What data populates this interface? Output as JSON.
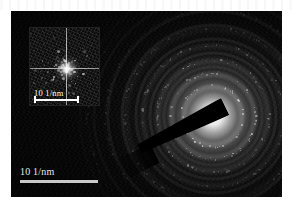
{
  "figure": {
    "kind": "tem-saed-diffraction-pattern",
    "background_color": "#ffffff",
    "canvas_color": "#050505"
  },
  "main_image": {
    "name": "selected-area-electron-diffraction-pattern",
    "scalebar": {
      "label": "10 1/nm",
      "value": 10,
      "unit": "1/nm",
      "length_px": 78,
      "color": "#c9c9c9"
    },
    "beam_stopper": {
      "name": "beam-stopper-bar",
      "color": "#000000"
    },
    "rings": {
      "count": 7,
      "center_x": 202,
      "center_y": 105,
      "radii_px": [
        31,
        43,
        56,
        71,
        88,
        107,
        126
      ],
      "intensity": [
        0.55,
        0.42,
        0.3,
        0.22,
        0.15,
        0.1,
        0.07
      ]
    }
  },
  "inset_image": {
    "name": "fft-inset",
    "scalebar": {
      "label": "10 1/nm",
      "value": 10,
      "unit": "1/nm",
      "length_px": 45,
      "color": "#ffffff"
    },
    "crosshair": {
      "name": "fft-crosshair",
      "color": "#ffffff"
    }
  },
  "chart_data": {
    "type": "scatter",
    "title": "",
    "xlabel": "",
    "ylabel": "",
    "annotations": [
      "10 1/nm",
      "10 1/nm"
    ],
    "series": [
      {
        "name": "saed-rings",
        "description": "Concentric polycrystalline diffraction rings",
        "radii_inverse_nm": [
          3.1,
          4.3,
          5.6,
          7.1,
          8.8,
          10.7,
          12.6
        ],
        "relative_intensity": [
          1.0,
          0.76,
          0.55,
          0.4,
          0.27,
          0.18,
          0.13
        ]
      },
      {
        "name": "fft-inset-spots",
        "description": "Bright central maximum with crossed streaks",
        "relative_intensity": [
          1.0
        ]
      }
    ]
  }
}
